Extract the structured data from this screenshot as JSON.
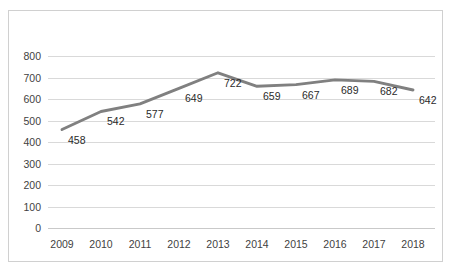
{
  "chart_data": {
    "type": "line",
    "title": "",
    "subtitle": "",
    "xlabel": "",
    "ylabel": "",
    "categories": [
      "2009",
      "2010",
      "2011",
      "2012",
      "2013",
      "2014",
      "2015",
      "2016",
      "2017",
      "2018"
    ],
    "values": [
      458,
      542,
      577,
      649,
      722,
      659,
      667,
      689,
      682,
      642
    ],
    "data_labels": [
      "458",
      "542",
      "577",
      "649",
      "722",
      "659",
      "667",
      "689",
      "682",
      "642"
    ],
    "series": [
      {
        "name": "",
        "values": [
          458,
          542,
          577,
          649,
          722,
          659,
          667,
          689,
          682,
          642
        ]
      }
    ],
    "ylim": [
      0,
      800
    ],
    "ytick_labels": [
      "800",
      "700",
      "600",
      "500",
      "400",
      "300",
      "200",
      "100",
      "0"
    ],
    "ytick_values": [
      800,
      700,
      600,
      500,
      400,
      300,
      200,
      100,
      0
    ],
    "xtick_labels": [
      "2009",
      "2010",
      "2011",
      "2012",
      "2013",
      "2014",
      "2015",
      "2016",
      "2017",
      "2018"
    ],
    "grid": "horizontal",
    "legend": "none",
    "legend_position": "",
    "markers": "none",
    "annotations": []
  },
  "style": {
    "line_color": "#808080",
    "grid_color": "#d9d9d9",
    "border_color": "#d0d0d0",
    "tick_label_color": "#3f3f3f",
    "data_label_color": "#2b2b2b",
    "background": "#ffffff"
  }
}
